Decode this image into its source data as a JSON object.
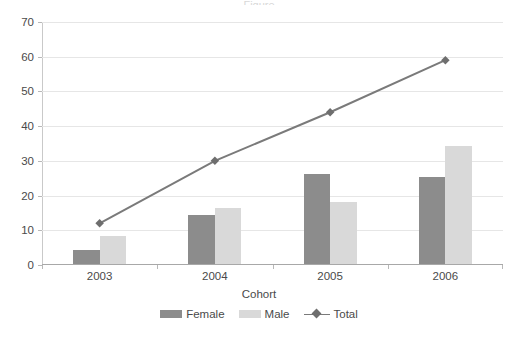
{
  "chart_data": {
    "type": "bar",
    "title": "",
    "xlabel": "Cohort",
    "ylabel": "",
    "categories": [
      "2003",
      "2004",
      "2005",
      "2006"
    ],
    "ylim": [
      0,
      70
    ],
    "yticks": [
      0,
      10,
      20,
      30,
      40,
      50,
      60,
      70
    ],
    "grid": true,
    "legend_position": "bottom-center",
    "series": [
      {
        "name": "Female",
        "type": "bar",
        "color": "#8c8c8c",
        "values": [
          4,
          14,
          26,
          25
        ]
      },
      {
        "name": "Male",
        "type": "bar",
        "color": "#d9d9d9",
        "values": [
          8,
          16,
          18,
          34
        ]
      },
      {
        "name": "Total",
        "type": "line",
        "color": "#7a7a7a",
        "marker": "diamond",
        "values": [
          12,
          30,
          44,
          59
        ]
      }
    ]
  },
  "axis": {
    "y_tick_labels": [
      "0",
      "10",
      "20",
      "30",
      "40",
      "50",
      "60",
      "70"
    ],
    "x_tick_labels": [
      "2003",
      "2004",
      "2005",
      "2006"
    ],
    "x_axis_title": "Cohort"
  },
  "legend": {
    "items": [
      {
        "label": "Female"
      },
      {
        "label": "Male"
      },
      {
        "label": "Total"
      }
    ]
  },
  "title_sliver": "Figure"
}
